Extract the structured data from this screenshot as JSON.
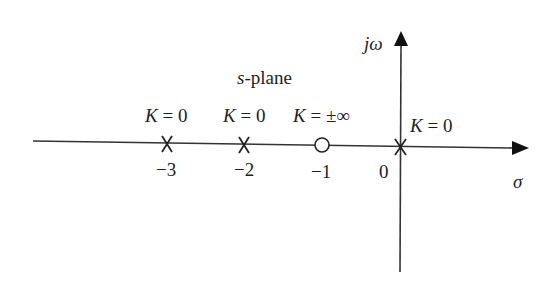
{
  "diagram": {
    "title": "s-plane",
    "title_prefix": "s",
    "title_suffix": "-plane",
    "axes": {
      "real_axis_label": "σ",
      "imag_axis_label": "jω",
      "origin_label": "0"
    },
    "tick_labels": [
      "−3",
      "−2",
      "−1"
    ],
    "poles": [
      {
        "position": -3,
        "marker": "x",
        "label_var": "K",
        "label_eq": " = 0"
      },
      {
        "position": -2,
        "marker": "x",
        "label_var": "K",
        "label_eq": " = 0"
      },
      {
        "position": 0,
        "marker": "x",
        "label_var": "K",
        "label_eq": " = 0"
      }
    ],
    "zeros": [
      {
        "position": -1,
        "marker": "o",
        "label_var": "K",
        "label_eq": " = ±∞"
      }
    ],
    "line_color": "#333333"
  }
}
